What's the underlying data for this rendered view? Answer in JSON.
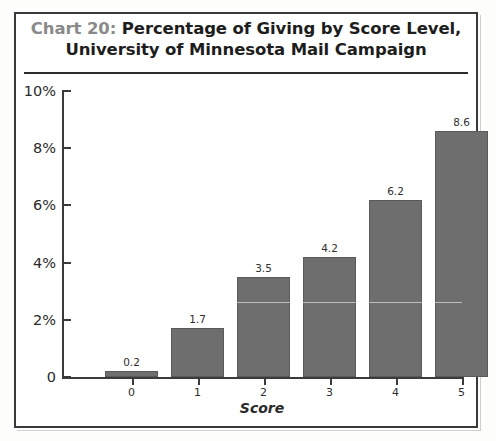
{
  "figure": {
    "border_color": "#3a3a3a",
    "background": "#ffffff"
  },
  "title": {
    "prefix": "Chart 20:",
    "line1_rest": " Percentage of Giving by Score Level,",
    "line2": "University of Minnesota Mail Campaign",
    "prefix_color": "#8a8a8a",
    "text_color": "#1d1d1d"
  },
  "chart_data": {
    "type": "bar",
    "title": "Chart 20: Percentage of Giving by Score Level, University of Minnesota Mail Campaign",
    "categories": [
      "0",
      "1",
      "2",
      "3",
      "4",
      "5"
    ],
    "values": [
      0.2,
      1.7,
      3.5,
      4.2,
      6.2,
      8.6
    ],
    "value_labels": [
      "0.2",
      "1.7",
      "3.5",
      "4.2",
      "6.2",
      "8.6"
    ],
    "xlabel": "Score",
    "ylabel": "",
    "ylim": [
      0,
      10
    ],
    "yticks": [
      0,
      2,
      4,
      6,
      8,
      10
    ],
    "ytick_labels": [
      "0",
      "2%",
      "4%",
      "6%",
      "8%",
      "10%"
    ],
    "grid": false,
    "legend": null,
    "bar_color": "#6e6e6e",
    "bar_edge_color": "#5a5a5a",
    "units": "percent"
  }
}
